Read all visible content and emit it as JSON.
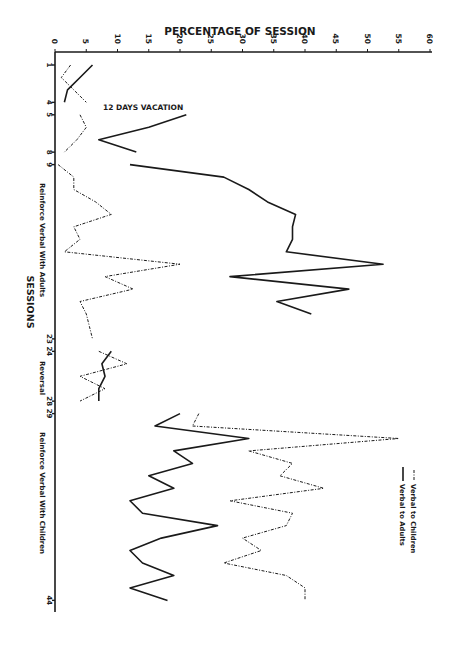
{
  "chart_data": {
    "type": "line",
    "orientation": "rotated-90",
    "title": "",
    "xlabel": "SESSIONS",
    "ylabel": "PERCENTAGE OF SESSION",
    "ylim": [
      0,
      60
    ],
    "y_ticks": [
      "0",
      "5",
      "10",
      "15",
      "20",
      "25",
      "30",
      "35",
      "40",
      "45",
      "50",
      "55",
      "60"
    ],
    "x_tick_labels": [
      "1",
      "4",
      "5",
      "8",
      "9",
      "23",
      "24",
      "28",
      "29",
      "44"
    ],
    "grid": false,
    "legend_position": "lower-right",
    "annotations": [
      "12 DAYS VACATION"
    ],
    "phases": [
      {
        "label": "Reinforce Verbal With Adults",
        "sessions": [
          9,
          23
        ]
      },
      {
        "label": "Reversal",
        "sessions": [
          24,
          28
        ]
      },
      {
        "label": "Reinforce Verbal With Children",
        "sessions": [
          29,
          44
        ]
      }
    ],
    "series": [
      {
        "name": "Verbal to Adults",
        "style": "solid",
        "segments": [
          {
            "x": [
              1,
              2,
              3,
              4
            ],
            "y": [
              6,
              4,
              2,
              1.5
            ]
          },
          {
            "x": [
              5,
              6,
              7,
              8
            ],
            "y": [
              21,
              15,
              7,
              13
            ]
          },
          {
            "x": [
              9,
              10,
              11,
              12,
              13,
              14,
              15,
              16,
              17,
              18,
              19,
              20,
              21
            ],
            "y": [
              12,
              27,
              31,
              34,
              38.5,
              38,
              38,
              37,
              52.5,
              28,
              47,
              35.5,
              41
            ]
          },
          {
            "x": [
              24,
              25,
              26,
              27,
              28
            ],
            "y": [
              9,
              7.5,
              8,
              7,
              7
            ]
          },
          {
            "x": [
              29,
              30,
              31,
              32,
              33,
              34,
              35,
              36,
              37,
              38,
              39,
              40,
              41,
              42,
              43,
              44
            ],
            "y": [
              20,
              16,
              31,
              19,
              22,
              15,
              19,
              12,
              14,
              26,
              17,
              12,
              14,
              19,
              12,
              18
            ]
          }
        ]
      },
      {
        "name": "Verbal to Children",
        "style": "dashed",
        "segments": [
          {
            "x": [
              1,
              2,
              3,
              4
            ],
            "y": [
              2.5,
              1,
              3,
              5
            ]
          },
          {
            "x": [
              5,
              6,
              7,
              8
            ],
            "y": [
              4,
              5,
              3.5,
              1.5
            ]
          },
          {
            "x": [
              9,
              10,
              11,
              12,
              13,
              14,
              15,
              16,
              17,
              18,
              19,
              20,
              21,
              22,
              23
            ],
            "y": [
              0.5,
              3,
              3,
              6.5,
              9,
              3,
              4,
              1.5,
              20,
              8,
              12.5,
              4,
              5,
              5.5,
              6
            ]
          },
          {
            "x": [
              24,
              25,
              26,
              27,
              28
            ],
            "y": [
              7,
              11.5,
              4,
              8,
              4
            ]
          },
          {
            "x": [
              29,
              30,
              31,
              32,
              33,
              34,
              35,
              36,
              37,
              38,
              39,
              40,
              41,
              42,
              43,
              44
            ],
            "y": [
              23,
              22,
              55,
              31,
              38,
              36,
              43,
              28,
              38,
              37,
              30,
              33,
              27,
              37,
              40,
              40
            ]
          }
        ]
      }
    ]
  },
  "labels": {
    "axis_title_top": "PERCENTAGE OF SESSION",
    "axis_title_left": "SESSIONS",
    "vacation": "12 DAYS VACATION",
    "phase_adults": "Reinforce Verbal With Adults",
    "phase_reversal": "Reversal",
    "phase_children": "Reinforce Verbal With Children",
    "legend_children": "Verbal to Children",
    "legend_adults": "Verbal to Adults"
  },
  "colors": {
    "ink": "#1a1a1a",
    "background": "#ffffff"
  }
}
